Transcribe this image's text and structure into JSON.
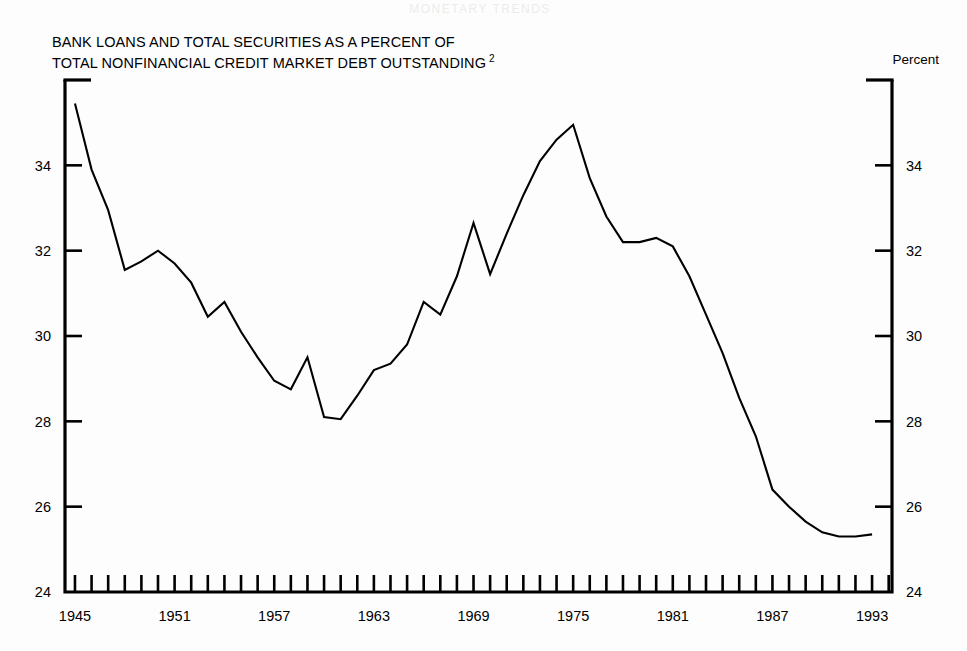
{
  "page": {
    "background_color": "#fdfdfd",
    "ink_color": "#000000",
    "faint_header_text": "MONETARY TRENDS"
  },
  "header": {
    "title_line_1": "BANK LOANS AND TOTAL SECURITIES AS A PERCENT OF",
    "title_line_2": "TOTAL NONFINANCIAL CREDIT MARKET DEBT OUTSTANDING",
    "title_footnote_marker": "2",
    "unit_label": "Percent"
  },
  "chart_data": {
    "type": "line",
    "xlabel": "",
    "ylabel": "Percent",
    "xlim": [
      1944.4,
      1994.2
    ],
    "ylim": [
      24,
      36
    ],
    "grid": false,
    "legend": false,
    "legend_position": "none",
    "line_color": "#000000",
    "x_tick_labels": [
      "1945",
      "1951",
      "1957",
      "1963",
      "1969",
      "1975",
      "1981",
      "1987",
      "1993"
    ],
    "x_tick_label_values": [
      1945,
      1951,
      1957,
      1963,
      1969,
      1975,
      1981,
      1987,
      1993
    ],
    "x_minor_tick_start": 1945,
    "x_minor_tick_end": 1994,
    "x_minor_tick_step": 1,
    "y_tick_labels": [
      "24",
      "26",
      "28",
      "30",
      "32",
      "34"
    ],
    "y_tick_values": [
      24,
      26,
      28,
      30,
      32,
      34
    ],
    "y_axis_both_sides": true,
    "x": [
      1945,
      1946,
      1947,
      1948,
      1949,
      1950,
      1951,
      1952,
      1953,
      1954,
      1955,
      1956,
      1957,
      1958,
      1959,
      1960,
      1961,
      1962,
      1963,
      1964,
      1965,
      1966,
      1967,
      1968,
      1969,
      1970,
      1971,
      1972,
      1973,
      1974,
      1975,
      1976,
      1977,
      1978,
      1979,
      1980,
      1981,
      1982,
      1983,
      1984,
      1985,
      1986,
      1987,
      1988,
      1989,
      1990,
      1991,
      1992,
      1993
    ],
    "values": [
      35.45,
      33.9,
      32.95,
      31.55,
      31.75,
      32.0,
      31.7,
      31.25,
      30.45,
      30.8,
      30.1,
      29.5,
      28.95,
      28.75,
      29.5,
      28.1,
      28.05,
      28.6,
      29.2,
      29.35,
      29.8,
      30.8,
      30.5,
      31.4,
      32.65,
      31.45,
      32.4,
      33.3,
      34.1,
      34.6,
      34.95,
      33.7,
      32.8,
      32.2,
      32.2,
      32.3,
      32.1,
      31.4,
      30.5,
      29.6,
      28.55,
      27.65,
      26.4,
      26.0,
      25.65,
      25.4,
      25.3,
      25.3,
      25.35
    ],
    "series": [
      {
        "name": "Bank loans and total securities as a percent of total nonfinancial credit market debt outstanding",
        "values": [
          35.45,
          33.9,
          32.95,
          31.55,
          31.75,
          32.0,
          31.7,
          31.25,
          30.45,
          30.8,
          30.1,
          29.5,
          28.95,
          28.75,
          29.5,
          28.1,
          28.05,
          28.6,
          29.2,
          29.35,
          29.8,
          30.8,
          30.5,
          31.4,
          32.65,
          31.45,
          32.4,
          33.3,
          34.1,
          34.6,
          34.95,
          33.7,
          32.8,
          32.2,
          32.2,
          32.3,
          32.1,
          31.4,
          30.5,
          29.6,
          28.55,
          27.65,
          26.4,
          26.0,
          25.65,
          25.4,
          25.3,
          25.3,
          25.35
        ]
      }
    ],
    "annotations": []
  }
}
